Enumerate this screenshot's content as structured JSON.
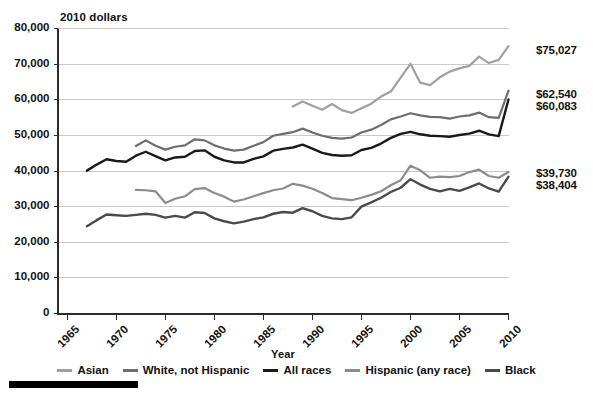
{
  "chart_data": {
    "type": "line",
    "title": "",
    "unit_label": "2010 dollars",
    "xlabel": "Year",
    "ylabel": "",
    "xlim": [
      1964,
      2010
    ],
    "ylim": [
      0,
      80000
    ],
    "grid": true,
    "legend_position": "bottom",
    "xticks": [
      1965,
      1970,
      1975,
      1980,
      1985,
      1990,
      1995,
      2000,
      2005,
      2010
    ],
    "xticklabels": [
      "1965",
      "1970",
      "1975",
      "1980",
      "1985",
      "1990",
      "1995",
      "2000",
      "2005",
      "2010"
    ],
    "yticks": [
      0,
      10000,
      20000,
      30000,
      40000,
      50000,
      60000,
      70000,
      80000
    ],
    "yticklabels": [
      "0",
      "10,000",
      "20,000",
      "30,000",
      "40,000",
      "50,000",
      "60,000",
      "70,000",
      "80,000"
    ],
    "series": [
      {
        "name": "Asian",
        "color": "#a0a0a0",
        "width": 2.2,
        "end_label": "$75,027",
        "x": [
          1988,
          1989,
          1990,
          1991,
          1992,
          1993,
          1994,
          1995,
          1996,
          1997,
          1998,
          1999,
          2000,
          2001,
          2002,
          2003,
          2004,
          2005,
          2006,
          2007,
          2008,
          2009,
          2010
        ],
        "y": [
          58100,
          59500,
          58300,
          57200,
          58800,
          57100,
          56300,
          57600,
          58900,
          60900,
          62300,
          66200,
          70100,
          64800,
          64100,
          66300,
          67900,
          68800,
          69500,
          72100,
          70300,
          71200,
          75027
        ]
      },
      {
        "name": "White, not Hispanic",
        "color": "#6e6e6e",
        "width": 2.2,
        "end_label": "$62,540",
        "x": [
          1972,
          1973,
          1974,
          1975,
          1976,
          1977,
          1978,
          1979,
          1980,
          1981,
          1982,
          1983,
          1984,
          1985,
          1986,
          1987,
          1988,
          1989,
          1990,
          1991,
          1992,
          1993,
          1994,
          1995,
          1996,
          1997,
          1998,
          1999,
          2000,
          2001,
          2002,
          2003,
          2004,
          2005,
          2006,
          2007,
          2008,
          2009,
          2010
        ],
        "y": [
          47000,
          48600,
          47100,
          46000,
          46800,
          47200,
          48900,
          48600,
          47200,
          46300,
          45700,
          46000,
          47100,
          48100,
          49900,
          50400,
          50900,
          51900,
          50800,
          49900,
          49300,
          49100,
          49400,
          50800,
          51600,
          52900,
          54500,
          55300,
          56200,
          55600,
          55200,
          55100,
          54700,
          55300,
          55600,
          56400,
          55100,
          54900,
          62540
        ]
      },
      {
        "name": "All races",
        "color": "#1a1a1a",
        "width": 2.4,
        "end_label": "$60,083",
        "x": [
          1967,
          1968,
          1969,
          1970,
          1971,
          1972,
          1973,
          1974,
          1975,
          1976,
          1977,
          1978,
          1979,
          1980,
          1981,
          1982,
          1983,
          1984,
          1985,
          1986,
          1987,
          1988,
          1989,
          1990,
          1991,
          1992,
          1993,
          1994,
          1995,
          1996,
          1997,
          1998,
          1999,
          2000,
          2001,
          2002,
          2003,
          2004,
          2005,
          2006,
          2007,
          2008,
          2009,
          2010
        ],
        "y": [
          40100,
          41800,
          43300,
          42800,
          42600,
          44300,
          45400,
          44200,
          43000,
          43800,
          44000,
          45600,
          45800,
          44000,
          43000,
          42400,
          42400,
          43400,
          44100,
          45700,
          46200,
          46600,
          47400,
          46300,
          45100,
          44500,
          44300,
          44400,
          45900,
          46500,
          47700,
          49300,
          50400,
          51000,
          50300,
          49900,
          49800,
          49600,
          50100,
          50500,
          51300,
          50300,
          49800,
          60083
        ]
      },
      {
        "name": "Hispanic (any race)",
        "color": "#8c8c8c",
        "width": 2.2,
        "end_label": "$39,730",
        "x": [
          1972,
          1973,
          1974,
          1975,
          1976,
          1977,
          1978,
          1979,
          1980,
          1981,
          1982,
          1983,
          1984,
          1985,
          1986,
          1987,
          1988,
          1989,
          1990,
          1991,
          1992,
          1993,
          1994,
          1995,
          1996,
          1997,
          1998,
          1999,
          2000,
          2001,
          2002,
          2003,
          2004,
          2005,
          2006,
          2007,
          2008,
          2009,
          2010
        ],
        "y": [
          34700,
          34600,
          34300,
          31000,
          32200,
          32900,
          34900,
          35200,
          33800,
          32800,
          31400,
          32000,
          32900,
          33800,
          34600,
          35100,
          36400,
          35900,
          35000,
          33800,
          32400,
          32100,
          31800,
          32500,
          33300,
          34300,
          36000,
          37400,
          41500,
          40200,
          38100,
          38400,
          38300,
          38600,
          39700,
          40400,
          38600,
          38100,
          39730
        ]
      },
      {
        "name": "Black",
        "color": "#4a4a4a",
        "width": 2.4,
        "end_label": "$38,404",
        "x": [
          1967,
          1968,
          1969,
          1970,
          1971,
          1972,
          1973,
          1974,
          1975,
          1976,
          1977,
          1978,
          1979,
          1980,
          1981,
          1982,
          1983,
          1984,
          1985,
          1986,
          1987,
          1988,
          1989,
          1990,
          1991,
          1992,
          1993,
          1994,
          1995,
          1996,
          1997,
          1998,
          1999,
          2000,
          2001,
          2002,
          2003,
          2004,
          2005,
          2006,
          2007,
          2008,
          2009,
          2010
        ],
        "y": [
          24500,
          26200,
          27800,
          27600,
          27400,
          27700,
          28000,
          27700,
          26900,
          27400,
          26900,
          28400,
          28200,
          26700,
          25900,
          25300,
          25800,
          26500,
          27000,
          28000,
          28500,
          28300,
          29600,
          28700,
          27400,
          26700,
          26500,
          27000,
          30000,
          31200,
          32500,
          34100,
          35300,
          37700,
          36200,
          35000,
          34300,
          35000,
          34400,
          35400,
          36500,
          35100,
          34200,
          38404
        ]
      }
    ],
    "end_labels": [
      "$75,027",
      "$62,540",
      "$60,083",
      "$39,730",
      "$38,404"
    ]
  },
  "legend": {
    "items": [
      {
        "label": "Asian",
        "color": "#a0a0a0"
      },
      {
        "label": "White, not Hispanic",
        "color": "#6e6e6e"
      },
      {
        "label": "All races",
        "color": "#1a1a1a"
      },
      {
        "label": "Hispanic (any race)",
        "color": "#8c8c8c"
      },
      {
        "label": "Black",
        "color": "#4a4a4a"
      }
    ]
  },
  "axes": {
    "unit_label": "2010 dollars",
    "x_title": "Year"
  }
}
